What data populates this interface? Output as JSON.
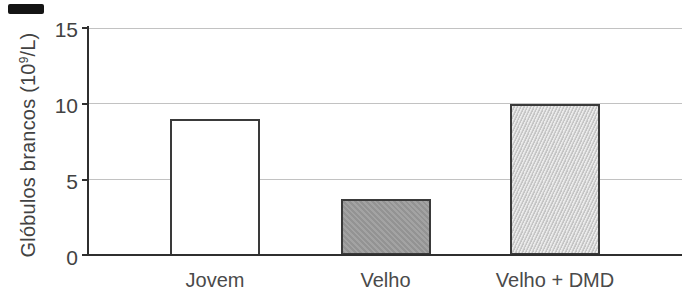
{
  "chart_data": {
    "type": "bar",
    "title": "",
    "ylabel": "Glóbulos brancos (10⁹/L)",
    "ylabel_parts": {
      "pre": "Glóbulos brancos (10",
      "sup": "9",
      "post": "/L)"
    },
    "xlabel": "",
    "categories": [
      "Jovem",
      "Velho",
      "Velho + DMD"
    ],
    "values": [
      9.0,
      3.7,
      10.0
    ],
    "ylim": [
      0,
      15
    ],
    "yticks": [
      0,
      5,
      10,
      15
    ],
    "grid": "horizontal-gridlines",
    "legend": "none",
    "bar_styles": [
      {
        "fill": "#ffffff",
        "texture": "none"
      },
      {
        "fill": "#9e9e9e",
        "texture": "mottled"
      },
      {
        "fill": "#d1d1d1",
        "texture": "diagonal-stipple"
      }
    ],
    "colors": {
      "background": "#ffffff",
      "text": "#424242",
      "axis": "#2f2f2f",
      "grid": "#c2c2c2",
      "bar_outline": "#3a3a3a",
      "scan_artifact": "#141414"
    }
  }
}
